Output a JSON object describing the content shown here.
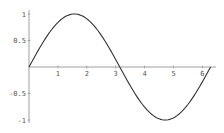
{
  "chart_data": {
    "type": "line",
    "title": "",
    "xlabel": "",
    "ylabel": "",
    "function": "sin(x)",
    "xlim": [
      0,
      6.2832
    ],
    "ylim": [
      -1,
      1
    ],
    "grid": false,
    "legend": null,
    "x_ticks": [
      1,
      2,
      3,
      4,
      5,
      6
    ],
    "x_tick_labels": [
      "1",
      "2",
      "3",
      "4",
      "5",
      "6"
    ],
    "y_ticks": [
      1,
      0.5,
      -0.5,
      -1
    ],
    "y_tick_labels": [
      "1",
      "0.5",
      "-0.5",
      "-1"
    ],
    "series": [
      {
        "name": "sin(x)",
        "color": "#333333",
        "x": [
          0,
          0.5236,
          1.0472,
          1.5708,
          2.0944,
          2.618,
          3.1416,
          3.6652,
          4.1888,
          4.7124,
          5.236,
          5.7596,
          6.2832
        ],
        "y": [
          0,
          0.5,
          0.866,
          1,
          0.866,
          0.5,
          0,
          -0.5,
          -0.866,
          -1,
          -0.866,
          -0.5,
          0
        ]
      }
    ]
  },
  "colors": {
    "axis": "#888888",
    "curve": "#333333",
    "label": "#555555"
  }
}
